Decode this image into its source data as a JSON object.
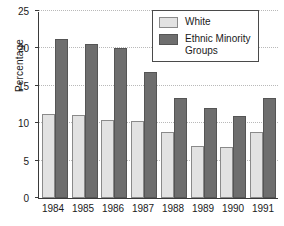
{
  "chart_data": {
    "type": "bar",
    "title": "",
    "xlabel": "",
    "ylabel": "Percentage",
    "categories": [
      "1984",
      "1985",
      "1986",
      "1987",
      "1988",
      "1989",
      "1990",
      "1991"
    ],
    "series": [
      {
        "name": "White",
        "values": [
          11.2,
          11.1,
          10.4,
          10.3,
          8.8,
          6.9,
          6.8,
          8.8
        ]
      },
      {
        "name": "Ethnic Minority\nGroups",
        "values": [
          21.3,
          20.6,
          20.0,
          16.8,
          13.4,
          12.0,
          10.9,
          13.4
        ]
      }
    ],
    "ylim": [
      0,
      25
    ],
    "yticks": [
      0,
      5,
      10,
      15,
      20,
      25
    ],
    "ytick_labels": [
      "0",
      "5",
      "10",
      "15",
      "20",
      "25"
    ],
    "grid": true,
    "legend_position": "top-right",
    "colors": {
      "white_bar": "#e2e2e2",
      "white_bar_edge": "#8a8a8a",
      "minority_bar": "#6e6e6e",
      "minority_bar_edge": "#555555",
      "axis": "#3a3a3a",
      "gridline": "#b9b9b9",
      "text": "#1a1a1a",
      "background": "#ffffff"
    }
  },
  "legend": {
    "items": [
      {
        "label": "White"
      },
      {
        "label": "Ethnic Minority\nGroups"
      }
    ]
  }
}
